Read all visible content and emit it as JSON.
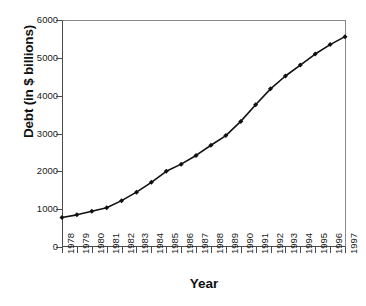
{
  "chart_data": {
    "type": "line",
    "title": "",
    "xlabel": "Year",
    "ylabel": "Debt (in $ billions)",
    "xlim": [
      1978,
      1997
    ],
    "ylim": [
      0,
      6000
    ],
    "ytick_labels": [
      "0",
      "1000",
      "2000",
      "3000",
      "4000",
      "5000",
      "6000"
    ],
    "ytick_values": [
      0,
      1000,
      2000,
      3000,
      4000,
      5000,
      6000
    ],
    "grid": false,
    "legend": "none",
    "marker": "diamond",
    "line_color": "#111111",
    "marker_color": "#111111",
    "categories": [
      "1978",
      "1979",
      "1980",
      "1981",
      "1982",
      "1983",
      "1984",
      "1985",
      "1986",
      "1987",
      "1988",
      "1989",
      "1990",
      "1991",
      "1992",
      "1993",
      "1994",
      "1995",
      "1996",
      "1997"
    ],
    "x": [
      1978,
      1979,
      1980,
      1981,
      1982,
      1983,
      1984,
      1985,
      1986,
      1987,
      1988,
      1989,
      1990,
      1991,
      1992,
      1993,
      1994,
      1995,
      1996,
      1997
    ],
    "values": [
      780,
      850,
      945,
      1035,
      1225,
      1450,
      1710,
      2000,
      2190,
      2420,
      2690,
      2945,
      3320,
      3760,
      4180,
      4520,
      4810,
      5100,
      5350,
      5560
    ],
    "series": [
      {
        "name": "Debt",
        "values": [
          780,
          850,
          945,
          1035,
          1225,
          1450,
          1710,
          2000,
          2190,
          2420,
          2690,
          2945,
          3320,
          3760,
          4180,
          4520,
          4810,
          5100,
          5350,
          5560
        ]
      }
    ]
  },
  "colors": {
    "background": "#ffffff",
    "axis_dark": "#4a4a4a",
    "axis_light": "#8a8a8a",
    "data": "#111111",
    "text": "#1a1a1a"
  }
}
